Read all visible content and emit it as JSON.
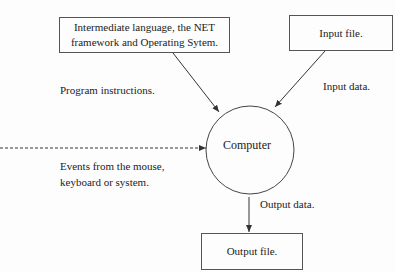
{
  "diagram": {
    "nodes": {
      "system": {
        "label_line1": "Intermediate language, the NET",
        "label_line2": "framework and Operating Sytem."
      },
      "input_file": {
        "label": "Input file."
      },
      "computer": {
        "label": "Computer"
      },
      "output_file": {
        "label": "Output file."
      }
    },
    "edges": {
      "program_instructions": {
        "label": "Program instructions."
      },
      "input_data": {
        "label": "Input data."
      },
      "events": {
        "label_line1": "Events from the mouse,",
        "label_line2": "keyboard or system."
      },
      "output_data": {
        "label": "Output data."
      }
    },
    "colors": {
      "line": "#333333",
      "background": "#fdfdfd"
    }
  }
}
